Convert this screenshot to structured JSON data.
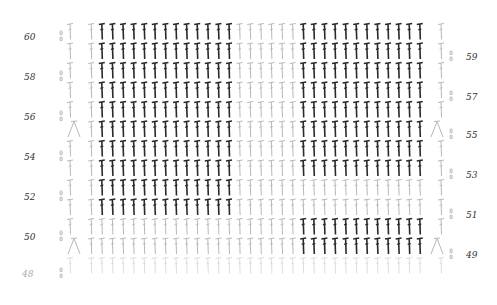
{
  "chart_title": "",
  "stitch_symbol": "double-crochet",
  "colors": {
    "background": "#ffffff",
    "dark_stitch": "#2a2a2a",
    "light_stitch": "#b8b8b8",
    "faint_stitch": "#d4d4d4",
    "label": "#333333"
  },
  "rows_left": [
    {
      "label": "60",
      "y": 38
    },
    {
      "label": "58",
      "y": 78
    },
    {
      "label": "56",
      "y": 118
    },
    {
      "label": "54",
      "y": 158
    },
    {
      "label": "52",
      "y": 198
    },
    {
      "label": "50",
      "y": 238
    },
    {
      "label": "48",
      "y": 275
    }
  ],
  "rows_right": [
    {
      "label": "59",
      "y": 58
    },
    {
      "label": "57",
      "y": 98
    },
    {
      "label": "55",
      "y": 136
    },
    {
      "label": "53",
      "y": 176
    },
    {
      "label": "51",
      "y": 216
    },
    {
      "label": "49",
      "y": 256
    }
  ],
  "grid": {
    "columns": 36,
    "x_start": 70,
    "col_spacing": 10.6,
    "rows": 13,
    "y_top": 22,
    "row_height": 19.5,
    "dark_blocks": [
      {
        "rows": [
          60,
          59,
          58,
          57,
          56,
          55
        ],
        "cols": [
          3,
          4,
          5,
          6,
          7,
          8,
          9,
          10,
          11,
          12,
          13,
          14,
          15
        ]
      },
      {
        "rows": [
          60,
          59,
          58,
          57,
          56,
          55
        ],
        "cols": [
          22,
          23,
          24,
          25,
          26,
          27,
          28,
          29,
          30,
          31,
          32,
          33
        ]
      },
      {
        "rows": [
          54,
          53,
          52,
          51
        ],
        "cols": [
          3,
          4,
          5,
          6,
          7,
          8,
          9,
          10,
          11,
          12,
          13,
          14,
          15
        ]
      },
      {
        "rows": [
          54,
          53
        ],
        "cols": [
          22,
          23,
          24,
          25,
          26,
          27,
          28,
          29,
          30,
          31,
          32,
          33,
          34
        ]
      },
      {
        "rows": [
          50,
          49
        ],
        "cols": [
          22,
          23,
          24,
          25,
          26,
          27,
          28,
          29,
          30,
          31,
          32,
          33
        ]
      }
    ],
    "increases": [
      {
        "row": 55,
        "side": "left"
      },
      {
        "row": 55,
        "side": "right"
      },
      {
        "row": 49,
        "side": "left"
      },
      {
        "row": 49,
        "side": "right"
      }
    ]
  }
}
